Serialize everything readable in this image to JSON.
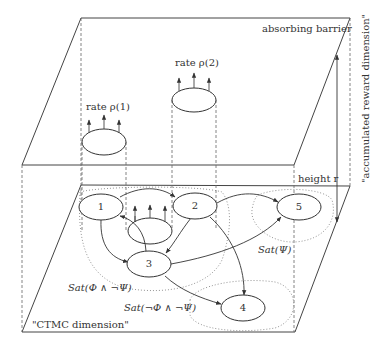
{
  "diagram": {
    "upper_plane": {
      "label": "absorbing barrier"
    },
    "lower_plane": {
      "label": "\"CTMC dimension\""
    },
    "vertical_axis": {
      "label": "\"accumulated reward dimension\"",
      "height_label": "height r"
    },
    "rate_labels": [
      {
        "id": "rate1",
        "text": "rate ρ(1)"
      },
      {
        "id": "rate2",
        "text": "rate ρ(2)"
      }
    ],
    "states": [
      {
        "id": "1",
        "label": "1"
      },
      {
        "id": "2",
        "label": "2"
      },
      {
        "id": "3",
        "label": "3"
      },
      {
        "id": "4",
        "label": "4"
      },
      {
        "id": "5",
        "label": "5"
      }
    ],
    "regions": [
      {
        "id": "sat_phi_not_psi",
        "label": "Sat(Φ ∧ ¬Ψ)",
        "members": [
          "1",
          "2",
          "3"
        ]
      },
      {
        "id": "sat_not_phi_not_psi",
        "label": "Sat(¬Φ ∧ ¬Ψ)",
        "members": [
          "4"
        ]
      },
      {
        "id": "sat_psi",
        "label": "Sat(Ψ)",
        "members": [
          "5"
        ]
      }
    ],
    "edges": [
      {
        "from": "1",
        "to": "2"
      },
      {
        "from": "1",
        "to": "3"
      },
      {
        "from": "3",
        "to": "1"
      },
      {
        "from": "2",
        "to": "3"
      },
      {
        "from": "2",
        "to": "5"
      },
      {
        "from": "2",
        "to": "4"
      },
      {
        "from": "3",
        "to": "5"
      },
      {
        "from": "3",
        "to": "4"
      }
    ]
  }
}
